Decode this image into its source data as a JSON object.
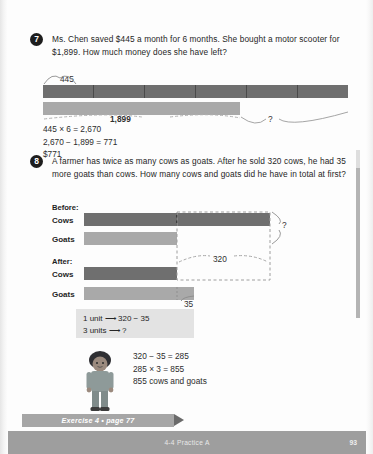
{
  "page": {
    "footer_title": "4-4  Practice A",
    "page_number": "93",
    "exercise_banner": "Exercise 4 • page 77"
  },
  "problems": [
    {
      "number": "7",
      "text": "Ms. Chen saved $445 a month for 6 months. She bought a motor scooter for $1,899. How much money does she have left?",
      "model": {
        "unit_label": "445",
        "spent_label": "1,899",
        "unknown_label": "?",
        "segments": 6
      },
      "work": "445 × 6 = 2,670\n2,670 − 1,899 = 771\n$771"
    },
    {
      "number": "8",
      "text": "A farmer has twice as many cows as goats. After he sold 320 cows, he had 35 more goats than cows. How many cows and goats did he have in total at first?",
      "before": {
        "heading": "Before:",
        "rows": [
          {
            "label": "Cows",
            "units": 2
          },
          {
            "label": "Goats",
            "units": 1
          }
        ],
        "total_label": "?"
      },
      "after": {
        "heading": "After:",
        "rows": [
          {
            "label": "Cows",
            "units": 1
          },
          {
            "label": "Goats",
            "units": 1
          }
        ],
        "sold_label": "320",
        "difference_label": "35"
      },
      "hint": "1 unit ⟶ 320 − 35\n3 units ⟶ ?",
      "work": "320 − 35 = 285\n285 × 3 = 855\n855 cows and goats"
    }
  ],
  "colors": {
    "bar_dark": "#6f6f6f",
    "bar_light": "#a9a9a9",
    "hint_background": "#e3e3e3",
    "banner": "#a6a6a6",
    "footer": "#9e9e9e"
  }
}
